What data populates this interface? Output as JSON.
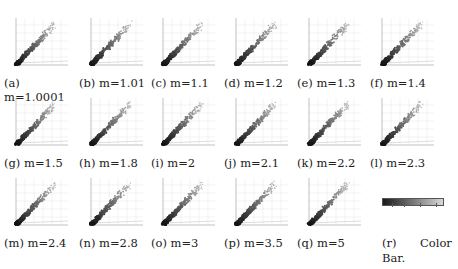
{
  "figure": {
    "panels": [
      {
        "id": "a",
        "label": "(a)",
        "param": "m=1.0001",
        "x": 0,
        "y": 15
      },
      {
        "id": "b",
        "label": "(b)",
        "param": "m=1.01",
        "x": 75,
        "y": 15
      },
      {
        "id": "c",
        "label": "(c)",
        "param": "m=1.1",
        "x": 147,
        "y": 15
      },
      {
        "id": "d",
        "label": "(d)",
        "param": "m=1.2",
        "x": 220,
        "y": 15
      },
      {
        "id": "e",
        "label": "(e)",
        "param": "m=1.3",
        "x": 293,
        "y": 15
      },
      {
        "id": "f",
        "label": "(f)",
        "param": "m=1.4",
        "x": 366,
        "y": 15
      },
      {
        "id": "g",
        "label": "(g)",
        "param": "m=1.5",
        "x": 0,
        "y": 95
      },
      {
        "id": "h",
        "label": "(h)",
        "param": "m=1.8",
        "x": 75,
        "y": 95
      },
      {
        "id": "i",
        "label": "(i)",
        "param": "m=2",
        "x": 147,
        "y": 95
      },
      {
        "id": "j",
        "label": "(j)",
        "param": "m=2.1",
        "x": 220,
        "y": 95
      },
      {
        "id": "k",
        "label": "(k)",
        "param": "m=2.2",
        "x": 293,
        "y": 95
      },
      {
        "id": "l",
        "label": "(l)",
        "param": "m=2.3",
        "x": 366,
        "y": 95
      },
      {
        "id": "m",
        "label": "(m)",
        "param": "m=2.4",
        "x": 0,
        "y": 175
      },
      {
        "id": "n",
        "label": "(n)",
        "param": "m=2.8",
        "x": 75,
        "y": 175
      },
      {
        "id": "o",
        "label": "(o)",
        "param": "m=3",
        "x": 147,
        "y": 175
      },
      {
        "id": "p",
        "label": "(p)",
        "param": "m=3.5",
        "x": 220,
        "y": 175
      },
      {
        "id": "q",
        "label": "(q)",
        "param": "m=5",
        "x": 293,
        "y": 175
      }
    ],
    "colorbar": {
      "label": "(r)",
      "caption_word": "Color",
      "caption_line2": "Bar.",
      "from_color": "#1a1a1a",
      "to_color": "#d8d8d8"
    }
  }
}
